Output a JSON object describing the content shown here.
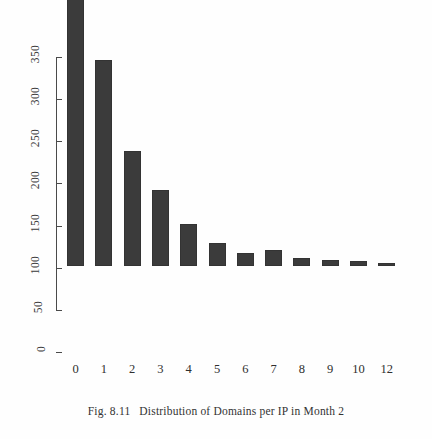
{
  "figure": {
    "caption_prefix": "Fig. 8.11",
    "caption_text": "Distribution of Domains per IP in Month 2"
  },
  "chart_data": {
    "type": "bar",
    "title": "",
    "xlabel": "",
    "ylabel": "",
    "categories": [
      "0",
      "1",
      "2",
      "3",
      "4",
      "5",
      "6",
      "7",
      "8",
      "9",
      "10",
      "12"
    ],
    "values": [
      397,
      245,
      137,
      90,
      50,
      27,
      16,
      19,
      9,
      7,
      6,
      3
    ],
    "ylim": [
      0,
      400
    ],
    "yticks": [
      0,
      50,
      100,
      150,
      200,
      250,
      300,
      350
    ],
    "ytick_labels": [
      "0",
      "50",
      "100",
      "150",
      "200",
      "250",
      "300",
      "350"
    ],
    "grid": false,
    "legend": null,
    "bar_color": "#3b3b3b",
    "axis_color": "#4a4a4a",
    "background": "#ffffff"
  }
}
